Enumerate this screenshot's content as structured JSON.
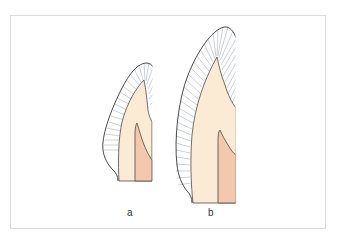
{
  "figure": {
    "panels": [
      {
        "id": "a",
        "label": "a"
      },
      {
        "id": "b",
        "label": "b"
      }
    ],
    "colors": {
      "enamel_fill": "#ffffff",
      "enamel_stroke": "#1e1e1e",
      "hatch": "#b8bfc4",
      "dentin": "#fbebd5",
      "pulp": "#f3c9ae",
      "line": "#333333",
      "frame": "#dcdcdc"
    }
  }
}
